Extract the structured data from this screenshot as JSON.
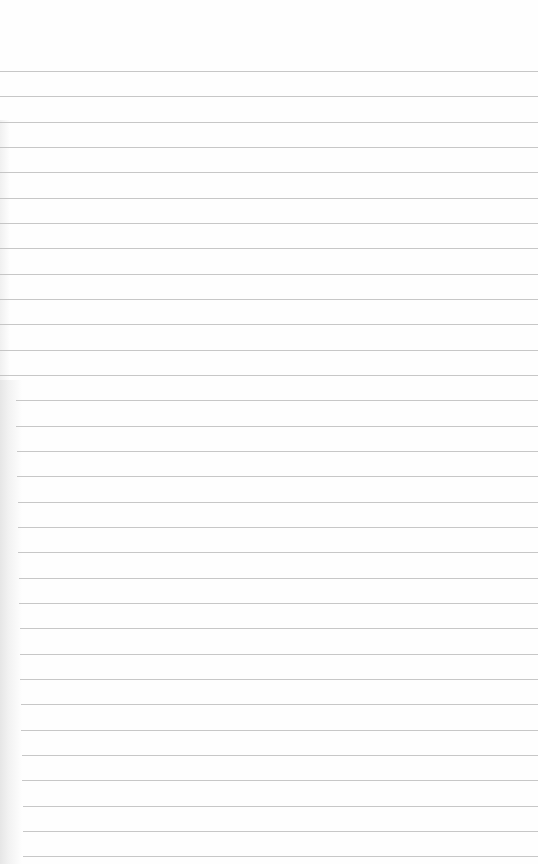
{
  "page": {
    "type": "blank lined paper",
    "background_color": "#fefefe",
    "line_color": "#bdbdbd",
    "first_line_y": 71,
    "line_spacing": 25.33,
    "line_count": 32
  }
}
